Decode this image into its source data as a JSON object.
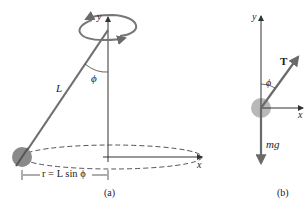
{
  "figure_a": {
    "caption": "(a)",
    "axis_y": "y",
    "axis_x": "x",
    "length_label": "L",
    "angle_label": "ϕ",
    "radius_label": "r = L sin ϕ"
  },
  "figure_b": {
    "caption": "(b)",
    "axis_y": "y",
    "axis_x": "x",
    "angle_label": "ϕ",
    "tension_label": "T⃗",
    "weight_label": "mg⃗"
  },
  "colors": {
    "rod": "#6f6f6f",
    "ball": "#8a8a8a",
    "ball_b": "#b8b8b8",
    "axis": "#333333",
    "arrow": "#6a6a6a"
  }
}
